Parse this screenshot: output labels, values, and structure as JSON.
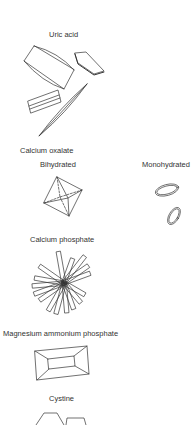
{
  "figure": {
    "sections": [
      {
        "id": "uric-acid",
        "title": "Uric acid"
      },
      {
        "id": "calcium-oxalate",
        "title": "Calcium oxalate",
        "subtypes": [
          {
            "label": "Bihydrated"
          },
          {
            "label": "Monohydrated"
          }
        ]
      },
      {
        "id": "calcium-phosphate",
        "title": "Calcium phosphate"
      },
      {
        "id": "magnesium-ammonium-phosphate",
        "title": "Magnesium ammonium phosphate"
      },
      {
        "id": "cystine",
        "title": "Cystine"
      }
    ],
    "colors": {
      "stroke": "#333333",
      "background": "#ffffff",
      "text": "#333333"
    }
  }
}
